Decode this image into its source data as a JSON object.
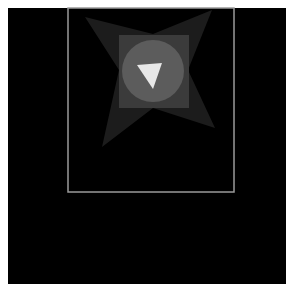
{
  "scene": {
    "background": "#000000",
    "page_background": "#ffffff",
    "frame": {
      "x": 68,
      "y": 8,
      "width": 166,
      "height": 184,
      "stroke": "#9a9a9a"
    },
    "star": {
      "points": "85,17 153,34 212,10 188,70 215,128 153,108 102,147 119,70",
      "fill": "#1c1c1c"
    },
    "square": {
      "x": 119,
      "y": 35,
      "width": 70,
      "height": 73,
      "fill": "#3b3b3b"
    },
    "circle": {
      "cx": 153,
      "cy": 71,
      "r": 31,
      "fill": "#5c5c5c"
    },
    "triangle": {
      "points": "137,65 162,63 153,89",
      "fill": "#e8e8e8"
    },
    "icon": "play-down-triangle-icon"
  }
}
